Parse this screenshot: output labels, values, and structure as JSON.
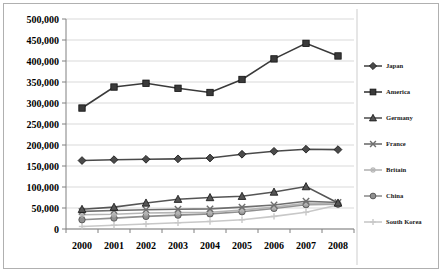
{
  "chart_data": {
    "type": "line",
    "title": "",
    "xlabel": "",
    "ylabel": "",
    "categories": [
      "2000",
      "2001",
      "2002",
      "2003",
      "2004",
      "2005",
      "2006",
      "2007",
      "2008"
    ],
    "ylim": [
      0,
      500000
    ],
    "ytick_labels": [
      "0",
      "50,000",
      "100,000",
      "150,000",
      "200,000",
      "250,000",
      "300,000",
      "350,000",
      "400,000",
      "450,000",
      "500,000"
    ],
    "ytick_values": [
      0,
      50000,
      100000,
      150000,
      200000,
      250000,
      300000,
      350000,
      400000,
      450000,
      500000
    ],
    "grid": true,
    "legend_position": "right",
    "series": [
      {
        "name": "Japan",
        "marker": "diamond",
        "color": "#4a4a4a",
        "values": [
          163000,
          165000,
          166000,
          167000,
          169000,
          178000,
          185000,
          190000,
          189000
        ]
      },
      {
        "name": "America",
        "marker": "square",
        "color": "#3a3a3a",
        "values": [
          288000,
          338000,
          347000,
          335000,
          325000,
          356000,
          405000,
          442000,
          412000
        ]
      },
      {
        "name": "Germany",
        "marker": "triangle",
        "color": "#555555",
        "values": [
          47000,
          52000,
          62000,
          71000,
          75000,
          78000,
          88000,
          101000,
          62000
        ]
      },
      {
        "name": "France",
        "marker": "cross-x",
        "color": "#6e6e6e",
        "values": [
          42000,
          44000,
          46000,
          47000,
          48000,
          52000,
          57000,
          66000,
          63000
        ]
      },
      {
        "name": "Britain",
        "marker": "asterisk",
        "color": "#b5b5b5",
        "values": [
          34000,
          35000,
          38000,
          39000,
          40000,
          45000,
          52000,
          61000,
          60000
        ]
      },
      {
        "name": "China",
        "marker": "circle",
        "color": "#909090",
        "values": [
          22000,
          26000,
          30000,
          33000,
          36000,
          41000,
          49000,
          58000,
          59000
        ]
      },
      {
        "name": "South Korea",
        "marker": "plus",
        "color": "#c8c8c8",
        "values": [
          6000,
          9000,
          12000,
          15000,
          18000,
          22000,
          30000,
          40000,
          57000
        ]
      }
    ]
  },
  "legend": {
    "items": [
      {
        "label": "Japan"
      },
      {
        "label": "America"
      },
      {
        "label": "Germany"
      },
      {
        "label": "France"
      },
      {
        "label": "Britain"
      },
      {
        "label": "China"
      },
      {
        "label": "South Korea"
      }
    ]
  }
}
